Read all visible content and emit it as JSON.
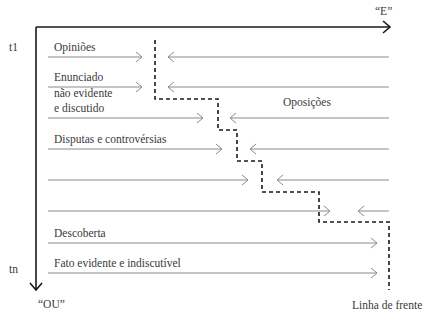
{
  "diagram": {
    "axes": {
      "horizontal_label": "“E”",
      "vertical_label": "“OU”",
      "time_start": "t1",
      "time_end": "tn"
    },
    "rows": [
      {
        "label": "Opiniões",
        "y": 57,
        "left_arrow_end": 142,
        "right_arrow_start": 168
      },
      {
        "label": "Enunciado",
        "y": 87,
        "left_arrow_end": 142,
        "right_arrow_start": 168
      },
      {
        "label": "",
        "y": 118,
        "left_arrow_end": 203,
        "right_arrow_start": 230
      },
      {
        "label": "Disputas e controvérsias",
        "y": 149,
        "left_arrow_end": 222,
        "right_arrow_start": 250
      },
      {
        "label": "",
        "y": 180,
        "left_arrow_end": 248,
        "right_arrow_start": 277
      },
      {
        "label": "",
        "y": 211,
        "left_arrow_end": 330,
        "right_arrow_start": 358
      },
      {
        "label": "Descoberta",
        "y": 243,
        "left_arrow_end": 377,
        "right_arrow_start": null
      },
      {
        "label": "Fato evidente e indiscutível",
        "y": 273,
        "left_arrow_end": 377,
        "right_arrow_start": null
      }
    ],
    "multiline_label": [
      "Enunciado",
      "não evidente",
      "e discutido"
    ],
    "oppositions_label": "Oposições",
    "front_line_label": "Linha de frente",
    "front_line_path": [
      [
        155,
        40
      ],
      [
        155,
        99
      ],
      [
        218,
        99
      ],
      [
        218,
        130
      ],
      [
        237,
        130
      ],
      [
        237,
        161
      ],
      [
        262,
        161
      ],
      [
        262,
        192
      ],
      [
        319,
        192
      ],
      [
        319,
        222
      ],
      [
        389,
        222
      ],
      [
        389,
        290
      ]
    ],
    "colors": {
      "axis": "#1a1a1a",
      "arrow": "#8a8a8a",
      "front_line": "#1a1a1a",
      "text": "#3a3a3a"
    }
  }
}
